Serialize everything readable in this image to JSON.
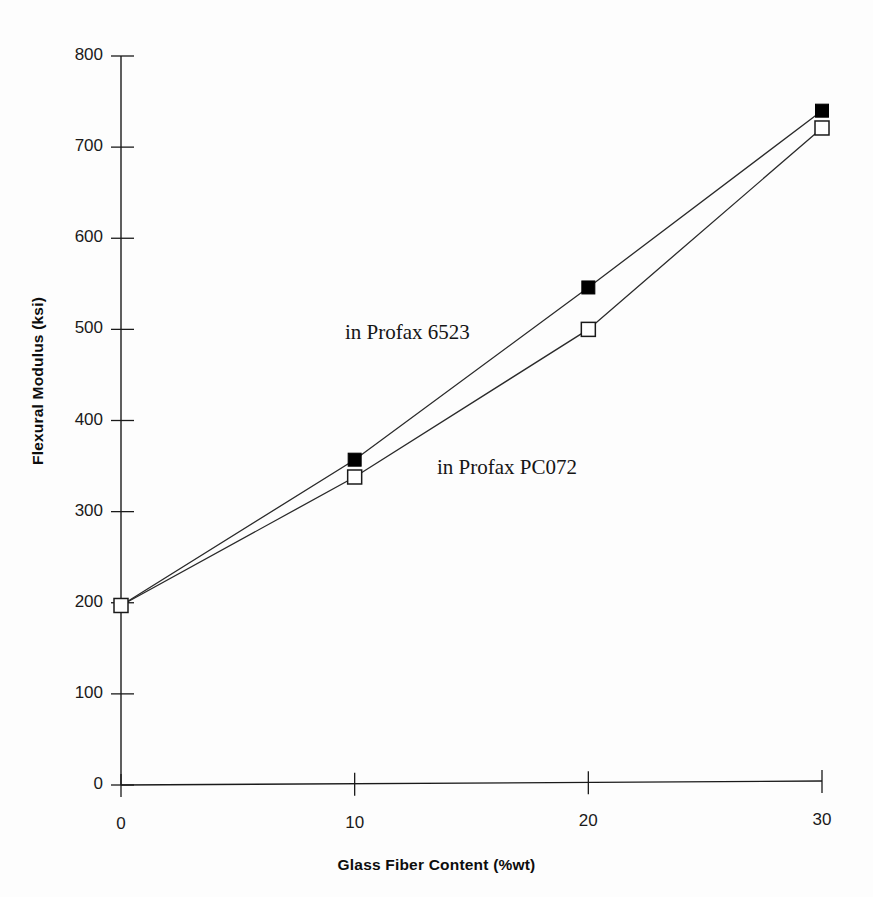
{
  "chart_data": {
    "type": "line",
    "title": "",
    "subtitle": "",
    "xlabel": "Glass Fiber Content (%wt)",
    "ylabel": "Flexural Modulus (ksi)",
    "x": [
      0,
      10,
      20,
      30
    ],
    "xlim": [
      0,
      30
    ],
    "ylim": [
      0,
      800
    ],
    "xticks": [
      "0",
      "10",
      "20",
      "30"
    ],
    "yticks": [
      "0",
      "100",
      "200",
      "300",
      "400",
      "500",
      "600",
      "700",
      "800"
    ],
    "grid": false,
    "legend_position": "inline-annotation",
    "series": [
      {
        "name": "in Profax 6523",
        "marker": "filled-square",
        "values": [
          197,
          357,
          546,
          740
        ]
      },
      {
        "name": "in Profax PC072",
        "marker": "open-square",
        "values": [
          197,
          338,
          500,
          721
        ]
      }
    ],
    "annotations": [
      {
        "text": "in Profax 6523",
        "x": 10.2,
        "y": 560
      },
      {
        "text": "in Profax PC072",
        "x": 14.5,
        "y": 378
      }
    ]
  },
  "axes": {
    "y_title": "Flexural Modulus (ksi)",
    "x_title": "Glass Fiber Content (%wt)",
    "y_ticks": [
      {
        "label": "800",
        "value": 800
      },
      {
        "label": "700",
        "value": 700
      },
      {
        "label": "600",
        "value": 600
      },
      {
        "label": "500",
        "value": 500
      },
      {
        "label": "400",
        "value": 400
      },
      {
        "label": "300",
        "value": 300
      },
      {
        "label": "200",
        "value": 200
      },
      {
        "label": "100",
        "value": 100
      },
      {
        "label": "0",
        "value": 0
      }
    ],
    "x_ticks": [
      {
        "label": "0",
        "value": 0
      },
      {
        "label": "10",
        "value": 10
      },
      {
        "label": "20",
        "value": 20
      },
      {
        "label": "30",
        "value": 30
      }
    ]
  },
  "colors": {
    "axis": "#1a1a1a",
    "line": "#2a2a2a",
    "marker_fill": "#000000",
    "marker_open_fill": "#ffffff",
    "text": "#111111",
    "background": "#fdfdfd"
  }
}
